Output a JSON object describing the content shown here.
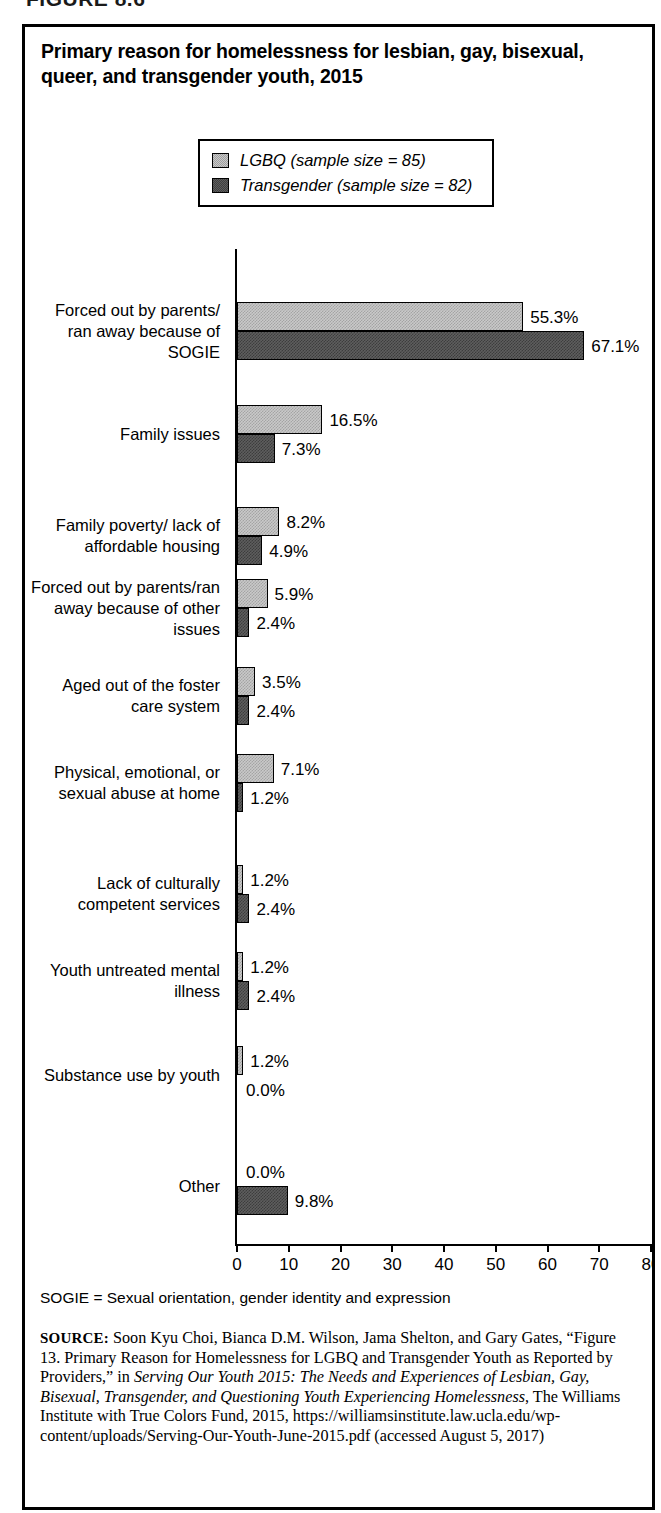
{
  "figure": {
    "heading": "FIGURE 8.6",
    "title": "Primary reason for homelessness for lesbian, gay, bisexual, queer, and transgender youth, 2015"
  },
  "legend": {
    "position": "top-center",
    "items": [
      {
        "label": "LGBQ (sample size = 85)",
        "swatch": "light-gray-hatch",
        "color": "#c9c9c9"
      },
      {
        "label": "Transgender (sample size = 82)",
        "swatch": "dark-gray-hatch",
        "color": "#5e5e5e"
      }
    ]
  },
  "notes": {
    "footnote": "SOGIE = Sexual orientation, gender identity and expression",
    "source_label": "SOURCE:",
    "source_part1": " Soon Kyu Choi, Bianca D.M. Wilson, Jama Shelton, and Gary Gates, “Figure 13. Primary Reason for Homelessness for LGBQ and Transgender Youth as Reported by Providers,” in ",
    "source_italic1": "Serving Our Youth 2015: The Needs and Experiences of Lesbian, Gay, Bisexual, Transgender, and Questioning Youth Experiencing Homelessness",
    "source_part2": ", The Williams Institute with True Colors Fund, 2015, https://williamsinstitute.law.ucla.edu/wp-content/uploads/Serving-Our-Youth-June-2015.pdf (accessed August 5, 2017)"
  },
  "chart_data": {
    "type": "bar",
    "orientation": "horizontal",
    "title": "Primary reason for homelessness for lesbian, gay, bisexual, queer, and transgender youth, 2015",
    "xlabel": "",
    "ylabel": "",
    "xlim": [
      0,
      80
    ],
    "xticks": [
      0,
      10,
      20,
      30,
      40,
      50,
      60,
      70,
      80
    ],
    "xtick_labels": [
      "0",
      "10",
      "20",
      "30",
      "40",
      "50",
      "60",
      "70",
      "80"
    ],
    "grid": false,
    "legend_position": "top-center",
    "categories": [
      "Forced out by parents/ ran away because of SOGIE",
      "Family issues",
      "Family poverty/ lack of affordable housing",
      "Forced out by parents/ran away because of other issues",
      "Aged out of the foster care system",
      "Physical, emotional, or sexual abuse at home",
      "Lack of culturally competent services",
      "Youth untreated mental illness",
      "Substance use by youth",
      "Other"
    ],
    "series": [
      {
        "name": "LGBQ (sample size = 85)",
        "values": [
          55.3,
          16.5,
          8.2,
          5.9,
          3.5,
          7.1,
          1.2,
          1.2,
          1.2,
          0.0
        ],
        "labels": [
          "55.3%",
          "16.5%",
          "8.2%",
          "5.9%",
          "3.5%",
          "7.1%",
          "1.2%",
          "1.2%",
          "1.2%",
          "0.0%"
        ],
        "color": "#c9c9c9"
      },
      {
        "name": "Transgender (sample size = 82)",
        "values": [
          67.1,
          7.3,
          4.9,
          2.4,
          2.4,
          1.2,
          2.4,
          2.4,
          0.0,
          9.8
        ],
        "labels": [
          "67.1%",
          "7.3%",
          "4.9%",
          "2.4%",
          "2.4%",
          "1.2%",
          "2.4%",
          "2.4%",
          "0.0%",
          "9.8%"
        ],
        "color": "#5e5e5e"
      }
    ]
  },
  "category_label_lines": [
    [
      "Forced out by parents/",
      "ran away because of",
      "SOGIE"
    ],
    [
      "Family issues"
    ],
    [
      "Family poverty/ lack of",
      "affordable housing"
    ],
    [
      "Forced out by parents/ran",
      "away because of other",
      "issues"
    ],
    [
      "Aged out of the foster",
      "care system"
    ],
    [
      "Physical, emotional, or",
      "sexual abuse at home"
    ],
    [
      "Lack of culturally",
      "competent services"
    ],
    [
      "Youth untreated mental",
      "illness"
    ],
    [
      "Substance use by youth"
    ],
    [
      "Other"
    ]
  ]
}
